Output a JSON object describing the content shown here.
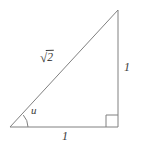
{
  "figure": {
    "name": "right-triangle-45-45-90",
    "background_color": "#ffffff",
    "stroke_color": "#808080",
    "text_color": "#3a3a3a",
    "stroke_width": 1,
    "width": 145,
    "height": 145
  },
  "geometry": {
    "vertices": {
      "bottom_left": {
        "x": 10,
        "y": 127
      },
      "bottom_right": {
        "x": 118,
        "y": 127
      },
      "top_right": {
        "x": 118,
        "y": 10
      }
    },
    "right_angle_marker": {
      "at_vertex": "bottom_right",
      "size": 12
    },
    "angle_arc": {
      "at_vertex": "bottom_left",
      "radius": 18
    }
  },
  "labels": {
    "hypotenuse": {
      "radical_sign": "√",
      "radicand": "2",
      "full_text": "√2"
    },
    "vertical_leg": "1",
    "base": "1",
    "angle": "u"
  }
}
